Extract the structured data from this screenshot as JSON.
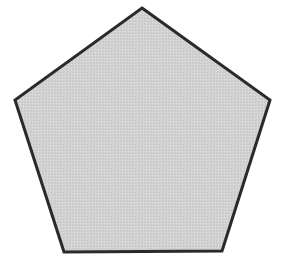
{
  "diagram": {
    "shape": "pentagon",
    "vertices": [
      {
        "x": 142,
        "y": 8
      },
      {
        "x": 270,
        "y": 100
      },
      {
        "x": 222,
        "y": 251
      },
      {
        "x": 64,
        "y": 252
      },
      {
        "x": 15,
        "y": 100
      }
    ],
    "fill_color": "#cfcfcf",
    "stroke_color": "#2a2a2a",
    "stroke_width": 3,
    "background_color": "#ffffff"
  }
}
